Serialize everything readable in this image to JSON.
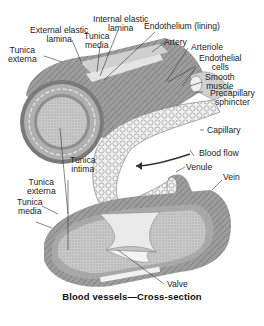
{
  "figure": {
    "caption": "Blood vessels—Cross-section",
    "colors": {
      "background": "#ffffff",
      "vessel_outer": "#8a8a8a",
      "vessel_media": "#b4b4b4",
      "vessel_lining": "#e0e0e0",
      "label_text": "#222222",
      "leader_line": "#333333"
    },
    "labels": {
      "tunica_externa_top": [
        "Tunica",
        "externa"
      ],
      "external_elastic_lamina": [
        "External elastic",
        "lamina"
      ],
      "tunica_media_top": [
        "Tunica",
        "media"
      ],
      "internal_elastic_lamina": [
        "Internal elastic",
        "lamina"
      ],
      "endothelium": "Endothelium (lining)",
      "artery": "Artery",
      "arteriole": "Arteriole",
      "endothelial_cells": [
        "Endothelial",
        "cells"
      ],
      "smooth_muscle": [
        "Smooth",
        "muscle"
      ],
      "precapillary_sphincter": [
        "Precapillary",
        "sphincter"
      ],
      "capillary": "Capillary",
      "blood_flow": "Blood flow",
      "venule": "Venule",
      "vein": "Vein",
      "tunica_intima": [
        "Tunica",
        "intima"
      ],
      "tunica_externa_bottom": [
        "Tunica",
        "externa"
      ],
      "tunica_media_bottom": [
        "Tunica",
        "media"
      ],
      "valve": "Valve"
    }
  }
}
